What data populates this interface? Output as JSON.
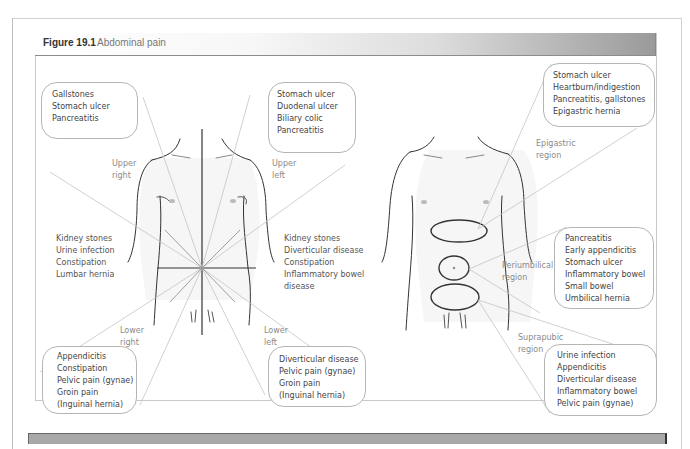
{
  "figure": {
    "number": "Figure 19.1",
    "title": "Abdominal pain"
  },
  "left_diagram": {
    "quadrant_labels": {
      "upper_right": [
        "Upper",
        "right"
      ],
      "upper_left": [
        "Upper",
        "left"
      ],
      "lower_right": [
        "Lower",
        "right"
      ],
      "lower_left": [
        "Lower",
        "left"
      ]
    },
    "bubbles": {
      "upper_right": [
        "Gallstones",
        "Stomach ulcer",
        "Pancreatitis"
      ],
      "upper_left": [
        "Stomach ulcer",
        "Duodenal ulcer",
        "Biliary colic",
        "Pancreatitis"
      ],
      "lower_right": [
        "Appendicitis",
        "Constipation",
        "Pelvic pain (gynae)",
        "Groin pain",
        "(Inguinal hernia)"
      ],
      "lower_left": [
        "Diverticular disease",
        "Pelvic pain (gynae)",
        "Groin pain",
        "(Inguinal hernia)"
      ]
    },
    "flank_lists": {
      "right": [
        "Kidney stones",
        "Urine infection",
        "Constipation",
        "Lumbar hernia"
      ],
      "left": [
        "Kidney stones",
        "Diverticular disease",
        "Constipation",
        "Inflammatory bowel",
        "disease"
      ]
    }
  },
  "right_diagram": {
    "region_labels": {
      "epigastric": [
        "Epigastric",
        "region"
      ],
      "periumbilical": [
        "Periumbilical",
        "region"
      ],
      "suprapubic": [
        "Suprapubic",
        "region"
      ]
    },
    "bubbles": {
      "epigastric": [
        "Stomach ulcer",
        "Heartburn/indigestion",
        "Pancreatitis, gallstones",
        "Epigastric hernia"
      ],
      "periumbilical": [
        "Pancreatitis",
        "Early appendicitis",
        "Stomach ulcer",
        "Inflammatory bowel",
        "Small bowel",
        "Umbilical hernia"
      ],
      "suprapubic": [
        "Urine infection",
        "Appendicitis",
        "Diverticular disease",
        "Inflammatory bowel",
        "Pelvic pain (gynae)"
      ]
    }
  },
  "colors": {
    "outline": "#333333",
    "connector": "#c4c4c4",
    "bubble_border": "#b5b5b5",
    "header_dark": "#9a9a9a"
  }
}
